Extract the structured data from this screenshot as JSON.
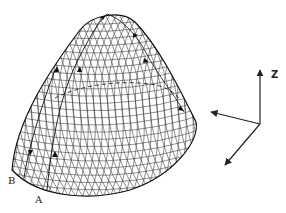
{
  "figure": {
    "labels": {
      "point_b": "B",
      "point_a": "A",
      "axis_z": "Z"
    },
    "colors": {
      "ink": "#222222",
      "background": "#ffffff"
    },
    "surface": {
      "apex": [
        107,
        14
      ],
      "left_base": [
        12,
        170
      ],
      "right_base": [
        196,
        125
      ],
      "bottom": [
        110,
        196
      ]
    },
    "axes": {
      "origin": [
        260,
        124
      ],
      "z_tip": [
        260,
        70
      ],
      "left_tip": [
        210,
        112
      ],
      "down_tip": [
        224,
        165
      ]
    }
  }
}
